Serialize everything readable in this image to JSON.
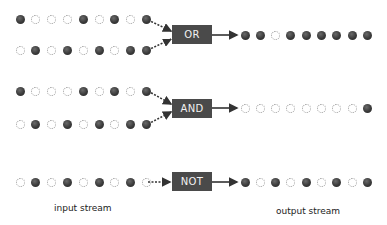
{
  "colors": {
    "gate_bg": "#4a4a4a",
    "gate_text": "#f2f2f2",
    "dot_on": "#333333",
    "dot_off": "#9a9a9a",
    "arrow": "#333333"
  },
  "gates": [
    {
      "label": "OR",
      "inputs": [
        [
          1,
          0,
          0,
          0,
          1,
          0,
          1,
          0,
          1
        ],
        [
          0,
          1,
          0,
          1,
          0,
          1,
          0,
          1,
          1
        ]
      ],
      "output": [
        1,
        1,
        0,
        1,
        1,
        1,
        1,
        1,
        1
      ]
    },
    {
      "label": "AND",
      "inputs": [
        [
          1,
          0,
          0,
          0,
          1,
          0,
          1,
          0,
          1
        ],
        [
          0,
          1,
          0,
          1,
          0,
          1,
          0,
          1,
          1
        ]
      ],
      "output": [
        0,
        0,
        0,
        0,
        0,
        0,
        0,
        0,
        1
      ]
    },
    {
      "label": "NOT",
      "inputs": [
        [
          0,
          1,
          0,
          1,
          0,
          1,
          0,
          1,
          0
        ]
      ],
      "output": [
        1,
        0,
        1,
        0,
        1,
        0,
        1,
        0,
        1
      ]
    }
  ],
  "captions": {
    "input": "input stream",
    "output": "output stream"
  }
}
